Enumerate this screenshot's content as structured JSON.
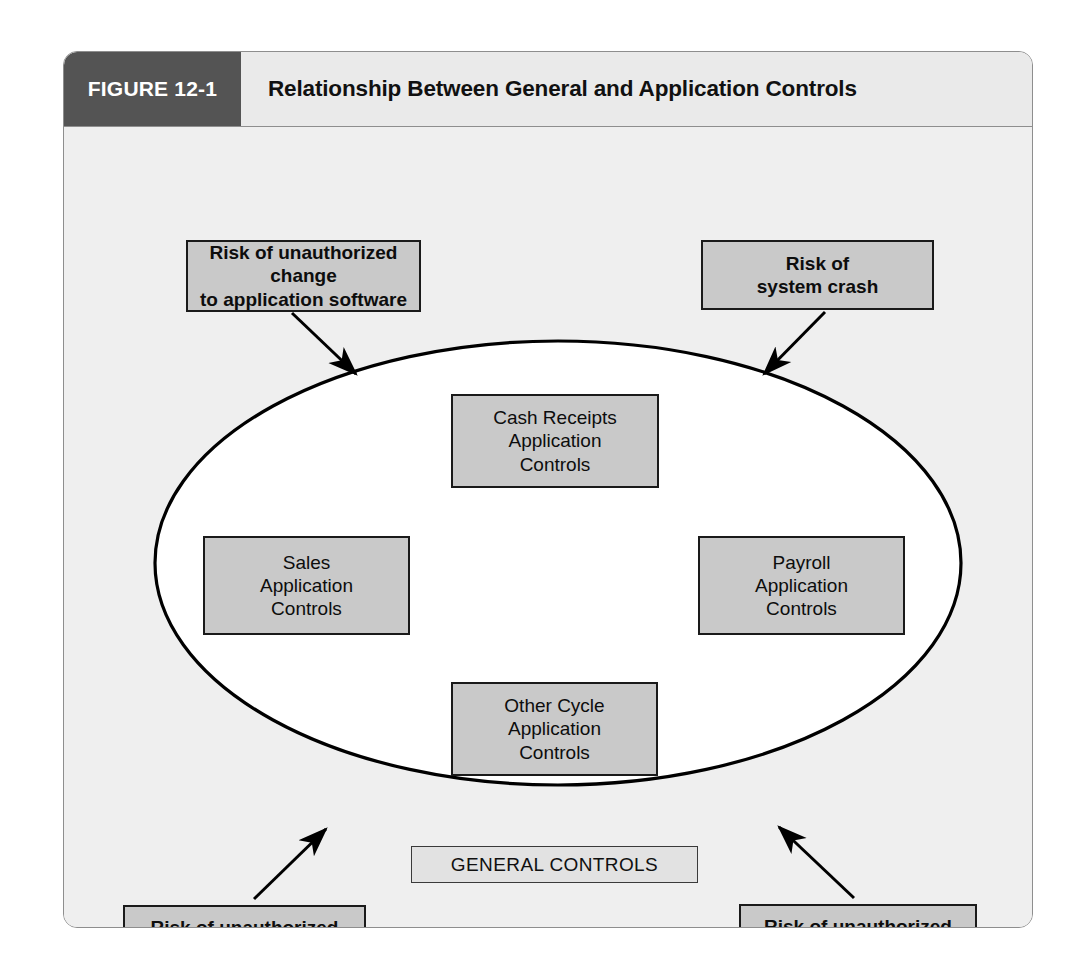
{
  "figure": {
    "number_label": "FIGURE 12-1",
    "title": "Relationship Between General and Application Controls"
  },
  "diagram": {
    "type": "concept-diagram",
    "container_label": "GENERAL CONTROLS",
    "ellipse_label": "GENERAL CONTROLS",
    "inner_boxes": [
      {
        "id": "cash-receipts",
        "lines": [
          "Cash Receipts",
          "Application",
          "Controls"
        ],
        "line1": "Cash Receipts",
        "line2": "Application",
        "line3": "Controls",
        "position": "top"
      },
      {
        "id": "sales",
        "lines": [
          "Sales",
          "Application",
          "Controls"
        ],
        "line1": "Sales",
        "line2": "Application",
        "line3": "Controls",
        "position": "left"
      },
      {
        "id": "payroll",
        "lines": [
          "Payroll",
          "Application",
          "Controls"
        ],
        "line1": "Payroll",
        "line2": "Application",
        "line3": "Controls",
        "position": "right"
      },
      {
        "id": "other-cycle",
        "lines": [
          "Other Cycle",
          "Application",
          "Controls"
        ],
        "line1": "Other Cycle",
        "line2": "Application",
        "line3": "Controls",
        "position": "bottom"
      }
    ],
    "risk_boxes": [
      {
        "id": "risk-unauthorized-change",
        "line1": "Risk of unauthorized change",
        "line2": "to application software",
        "position": "top-left",
        "arrow": "points down-right into ellipse"
      },
      {
        "id": "risk-system-crash",
        "line1": "Risk of",
        "line2": "system crash",
        "position": "top-right",
        "arrow": "points down-left into ellipse"
      },
      {
        "id": "risk-unauthorized-master-file-update",
        "line1": "Risk of unauthorized",
        "line2": "master file update",
        "position": "bottom-left",
        "arrow": "points up-right into ellipse"
      },
      {
        "id": "risk-unauthorized-processing",
        "line1": "Risk of unauthorized",
        "line2": "processing",
        "position": "bottom-right",
        "arrow": "points up-left into ellipse"
      }
    ]
  },
  "colors": {
    "header_block": "#545454",
    "header_band": "#eaeaea",
    "canvas": "#efefef",
    "box_fill": "#c9c9c9",
    "box_border": "#1a1a1a",
    "general_controls_fill": "#e2e2e2",
    "ellipse_fill": "#ffffff",
    "ellipse_stroke": "#000000",
    "frame_border": "#8e8e8e"
  }
}
